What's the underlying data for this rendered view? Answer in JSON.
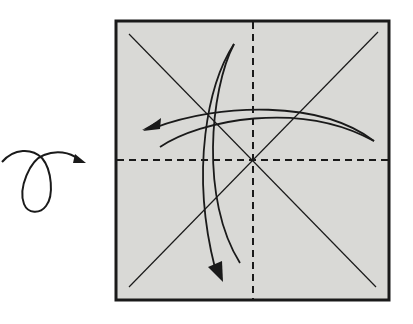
{
  "diagram": {
    "type": "origami-step",
    "paper": {
      "fill": "#d9d9d6",
      "border": "#1a1a1a",
      "x": 116,
      "y": 21,
      "size_w": 273,
      "size_h": 279
    },
    "symbols": [
      {
        "name": "turn-over-symbol",
        "meaning": "turn over"
      },
      {
        "name": "fold-unfold-arrow-vertical",
        "meaning": "fold and unfold"
      },
      {
        "name": "fold-unfold-arrow-horizontal",
        "meaning": "fold and unfold"
      }
    ],
    "creases": [
      {
        "name": "diagonal-crease-1",
        "style": "solid"
      },
      {
        "name": "diagonal-crease-2",
        "style": "solid"
      },
      {
        "name": "vertical-midline",
        "style": "dashed"
      },
      {
        "name": "horizontal-midline",
        "style": "dashed"
      }
    ],
    "colors": {
      "line": "#1a1a1a",
      "paper": "#d9d9d6",
      "background": "#ffffff"
    }
  }
}
